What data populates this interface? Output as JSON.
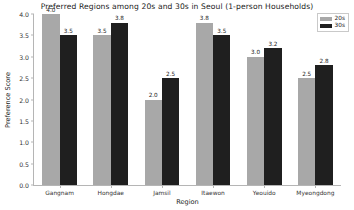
{
  "chart_data": {
    "type": "bar",
    "title": "Preferred Regions among 20s and 30s in Seoul (1-person Households)",
    "xlabel": "Region",
    "ylabel": "Preference Score",
    "categories": [
      "Gangnam",
      "Hongdae",
      "Jamsil",
      "Itaewon",
      "Yeouido",
      "Myeongdong"
    ],
    "series": [
      {
        "name": "20s",
        "color": "#a8a8a8",
        "values": [
          4.0,
          3.5,
          2.0,
          3.8,
          3.0,
          2.5
        ]
      },
      {
        "name": "30s",
        "color": "#1f1f1f",
        "values": [
          3.5,
          3.8,
          2.5,
          3.5,
          3.2,
          2.8
        ]
      }
    ],
    "value_labels": [
      [
        "4.0",
        "3.5",
        "2.0",
        "3.8",
        "3.0",
        "2.5"
      ],
      [
        "3.5",
        "3.8",
        "2.5",
        "3.5",
        "3.2",
        "2.8"
      ]
    ],
    "ylim": [
      0.0,
      4.0
    ],
    "yticks": [
      "0.0",
      "0.5",
      "1.0",
      "1.5",
      "2.0",
      "2.5",
      "3.0",
      "3.5",
      "4.0"
    ],
    "ytick_values": [
      0.0,
      0.5,
      1.0,
      1.5,
      2.0,
      2.5,
      3.0,
      3.5,
      4.0
    ],
    "grid": false,
    "legend_position": "upper right",
    "background": "#ffffff",
    "axis_color": "#b5b5b5"
  }
}
